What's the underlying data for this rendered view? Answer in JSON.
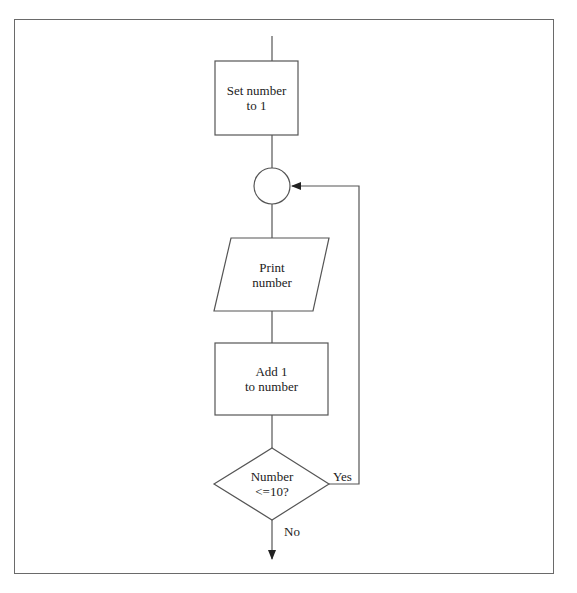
{
  "diagram": {
    "type": "flowchart",
    "nodes": [
      {
        "id": "init",
        "shape": "rectangle",
        "lines": [
          "Set number",
          "to 1"
        ]
      },
      {
        "id": "connector",
        "shape": "circle",
        "lines": []
      },
      {
        "id": "print",
        "shape": "parallelogram",
        "lines": [
          "Print",
          "number"
        ]
      },
      {
        "id": "increment",
        "shape": "rectangle",
        "lines": [
          "Add 1",
          "to number"
        ]
      },
      {
        "id": "decision",
        "shape": "diamond",
        "lines": [
          "Number",
          "<=10?"
        ]
      }
    ],
    "edges": [
      {
        "from": "start",
        "to": "init",
        "label": ""
      },
      {
        "from": "init",
        "to": "connector",
        "label": ""
      },
      {
        "from": "connector",
        "to": "print",
        "label": ""
      },
      {
        "from": "print",
        "to": "increment",
        "label": ""
      },
      {
        "from": "increment",
        "to": "decision",
        "label": ""
      },
      {
        "from": "decision",
        "to": "connector",
        "label": "Yes"
      },
      {
        "from": "decision",
        "to": "end",
        "label": "No"
      }
    ],
    "edge_labels": {
      "yes": "Yes",
      "no": "No"
    },
    "colors": {
      "stroke": "#555555",
      "frame": "#6a6a6a",
      "text": "#222222",
      "background": "#ffffff"
    }
  }
}
